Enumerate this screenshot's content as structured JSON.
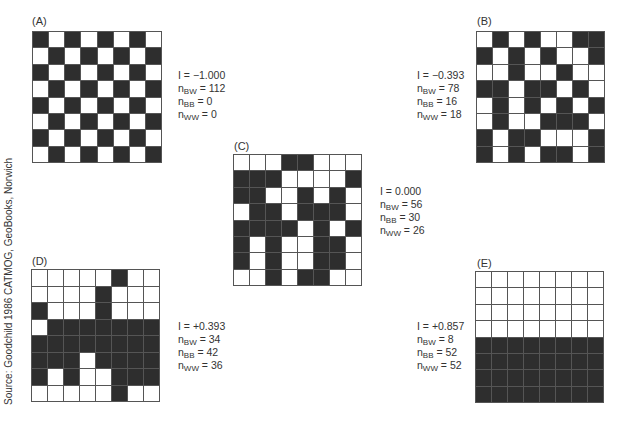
{
  "source": "Source: Goodchild 1986 CATMOG, GeoBooks, Norwich",
  "colors": {
    "black": "#2e2e2e",
    "white": "#ffffff",
    "grid_line": "#555555"
  },
  "panels": [
    {
      "id": "A",
      "label": "(A)",
      "x": 32,
      "y": 31,
      "w": 130,
      "h": 132,
      "labelX": 32,
      "labelY": 15,
      "statsX": 178,
      "statsY": 69,
      "I": "I = −1.000",
      "nBW": "112",
      "nBB": "0",
      "nWW": "0",
      "rows": [
        "BWBWBWBW",
        "WBWBWBWB",
        "BWBWBWBW",
        "WBWBWBWB",
        "BWBWBWBW",
        "WBWBWBWB",
        "BWBWBWBW",
        "WBWBWBWB"
      ]
    },
    {
      "id": "B",
      "label": "(B)",
      "x": 476,
      "y": 31,
      "w": 129,
      "h": 132,
      "labelX": 477,
      "labelY": 15,
      "statsX": 417,
      "statsY": 69,
      "I": "I = −0.393",
      "nBW": "78",
      "nBB": "16",
      "nWW": "18",
      "rows": [
        "WBWBWWBB",
        "BWBWBWWB",
        "WWBWWBWW",
        "BBWBBWBW",
        "WBWBWBWB",
        "WBWWBBBW",
        "BWBBWWWB",
        "BWBWBBWB"
      ]
    },
    {
      "id": "C",
      "label": "(C)",
      "x": 233,
      "y": 154,
      "w": 129,
      "h": 132,
      "labelX": 234,
      "labelY": 140,
      "statsX": 380,
      "statsY": 185,
      "I": "I = 0.000",
      "nBW": "56",
      "nBB": "30",
      "nWW": "26",
      "rows": [
        "WWWBBWWW",
        "BBBWWWWB",
        "BBWWBWBW",
        "WBBWBBBW",
        "BBBBWBWB",
        "BWBWWBBW",
        "BWBWWBBW",
        "WWBWBBWW"
      ]
    },
    {
      "id": "D",
      "label": "(D)",
      "x": 31,
      "y": 269,
      "w": 129,
      "h": 133,
      "labelX": 32,
      "labelY": 255,
      "statsX": 178,
      "statsY": 320,
      "I": "I = +0.393",
      "nBW": "34",
      "nBB": "42",
      "nWW": "36",
      "rows": [
        "WWWWWBWW",
        "WWWWBWWW",
        "BWWWBWWW",
        "WBBBBBBB",
        "BBBBBBBB",
        "BBBWBBBB",
        "BWBWWBBB",
        "WWWWWBWW"
      ]
    },
    {
      "id": "E",
      "label": "(E)",
      "x": 475,
      "y": 271,
      "w": 129,
      "h": 132,
      "labelX": 477,
      "labelY": 257,
      "statsX": 417,
      "statsY": 320,
      "I": "I = +0.857",
      "nBW": "8",
      "nBB": "52",
      "nWW": "52",
      "rows": [
        "WWWWWWWW",
        "WWWWWWWW",
        "WWWWWWWW",
        "WWWWWWWW",
        "BBBBBBBB",
        "BBBBBBBB",
        "BBBBBBBB",
        "BBBBBBBB"
      ]
    }
  ]
}
